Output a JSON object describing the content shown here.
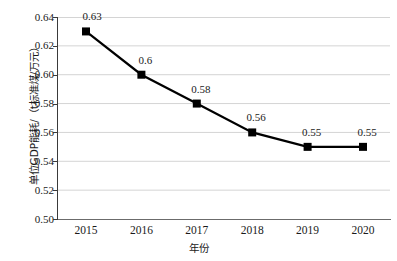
{
  "chart_data": {
    "type": "line",
    "title": "",
    "xlabel": "年份",
    "ylabel": "单位GDP能耗/（t标准煤/万元）",
    "categories": [
      "2015",
      "2016",
      "2017",
      "2018",
      "2019",
      "2020"
    ],
    "values": [
      0.63,
      0.6,
      0.58,
      0.56,
      0.55,
      0.55
    ],
    "point_labels": [
      "0.63",
      "0.6",
      "0.58",
      "0.56",
      "0.55",
      "0.55"
    ],
    "ylim": [
      0.5,
      0.64
    ],
    "ytick_labels": [
      "0.64",
      "0.62",
      "0.60",
      "0.58",
      "0.56",
      "0.54",
      "0.52",
      "0.50"
    ],
    "ytick_values": [
      0.64,
      0.62,
      0.6,
      0.58,
      0.56,
      0.54,
      0.52,
      0.5
    ],
    "grid": "horizontal",
    "legend": "none",
    "series_color": "#000000",
    "grid_color": "#d4d4d4",
    "marker": "square",
    "background": "#ffffff"
  }
}
